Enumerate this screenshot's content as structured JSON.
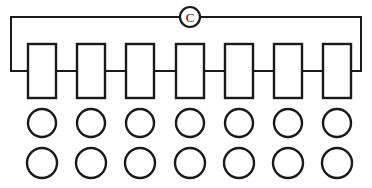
{
  "diagram": {
    "canvas": {
      "width": 372,
      "height": 188,
      "background": "#ffffff"
    },
    "stroke_color": "#1a1a1a",
    "meter": {
      "label": "C",
      "shape": "circle",
      "cx": 190,
      "cy": 17,
      "r": 10,
      "icon_name": "meter-c-icon"
    },
    "loop": {
      "top_y": 17,
      "left_x": 11,
      "right_x": 361,
      "bus_y": 71,
      "left_drop_x": 11,
      "right_drop_x": 361,
      "left_bus_end_x": 28,
      "right_bus_start_x": 344
    },
    "modules": {
      "count": 7,
      "width": 28,
      "height": 54,
      "top_y": 44,
      "bottom_y": 98,
      "centers_x": [
        42,
        91,
        140,
        190,
        239,
        288,
        337
      ],
      "labels": [
        "",
        "",
        "",
        "",
        "",
        "",
        ""
      ]
    },
    "node_rows": [
      {
        "row_name": "upper-node-row",
        "count": 7,
        "radius": 14,
        "cy": 123,
        "centers_x": [
          42,
          91,
          140,
          190,
          239,
          288,
          337
        ]
      },
      {
        "row_name": "lower-node-row",
        "count": 7,
        "radius": 15,
        "cy": 163,
        "centers_x": [
          42,
          91,
          140,
          190,
          239,
          288,
          337
        ]
      }
    ]
  }
}
